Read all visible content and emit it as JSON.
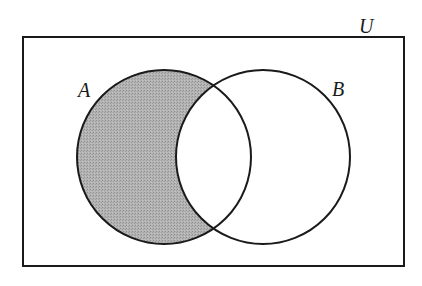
{
  "diagram": {
    "type": "venn",
    "universe": {
      "label": "U",
      "rect": {
        "x": 23,
        "y": 37,
        "width": 381,
        "height": 229
      },
      "label_pos": {
        "x": 359,
        "y": 33
      }
    },
    "sets": [
      {
        "id": "A",
        "label": "A",
        "cx": 164,
        "cy": 157,
        "r": 87,
        "label_pos": {
          "x": 78,
          "y": 97
        }
      },
      {
        "id": "B",
        "label": "B",
        "cx": 263,
        "cy": 157,
        "r": 87,
        "label_pos": {
          "x": 332,
          "y": 96
        }
      }
    ],
    "shaded_region": "A − B (A only)",
    "colors": {
      "stroke": "#1a1a1a",
      "shade": "#a9a9a9",
      "background": "#ffffff"
    }
  }
}
